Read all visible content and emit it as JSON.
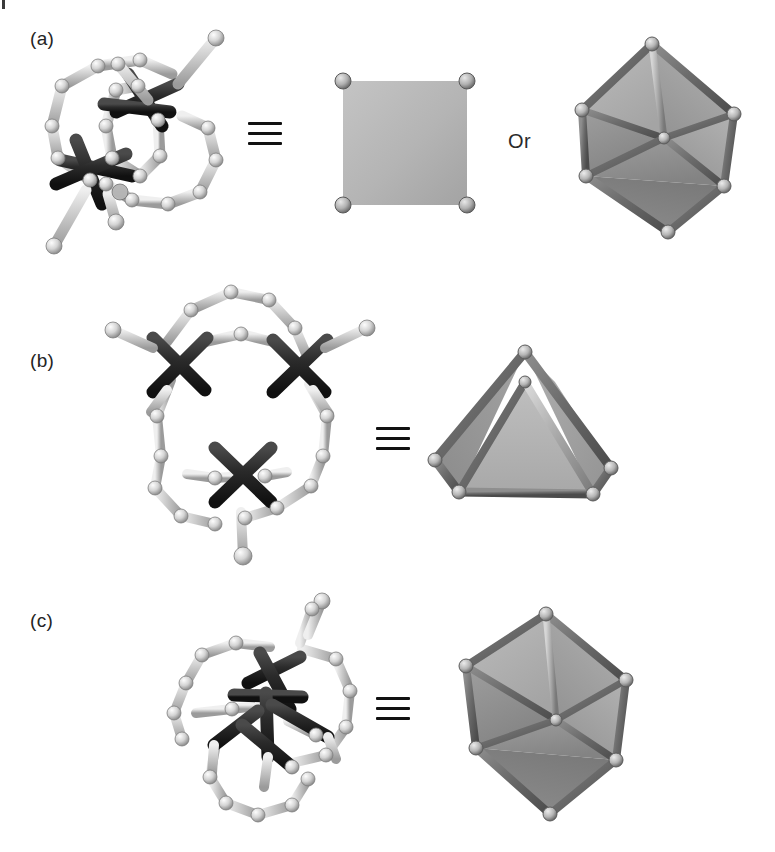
{
  "figure": {
    "type": "scientific-figure",
    "background_color": "#ffffff",
    "width": 775,
    "height": 852,
    "top_artifact": "|"
  },
  "colors": {
    "metal_dark": "#2b2b2b",
    "metal_dark_shade": "#141414",
    "ligand_light": "#c9c9c9",
    "ligand_light_shade": "#9e9e9e",
    "ligand_highlight": "#eeeeee",
    "node_sphere": "#d8d8d8",
    "polyhedron_face_light": "#b9b9b9",
    "polyhedron_face_mid": "#a6a6a6",
    "polyhedron_face_dark": "#8a8a8a",
    "polyhedron_edge": "#6e6e6e",
    "polyhedron_edge_dark": "#5a5a5a",
    "polyhedron_vertex": "#cfcfcf",
    "text": "#242424",
    "equiv_bar": "#111111"
  },
  "panels": [
    {
      "id": "a",
      "label": "(a)",
      "label_x": 30,
      "label_y": 28,
      "structure": {
        "name": "square-cage-structure",
        "geometry": "square",
        "metal_centers": 2,
        "description": "Ball-and-stick cage with two octahedral metal nodes bridged by macrocyclic ligand loops"
      },
      "equivalence_symbol": "≡",
      "equivalence_x": 248,
      "equivalence_y": 122,
      "polyhedra": [
        {
          "name": "square-polyhedron",
          "shape": "square",
          "vertices": 4,
          "faces": 1,
          "edges": 4
        },
        {
          "name": "octahedron-polyhedron",
          "shape": "octahedron",
          "vertices": 6,
          "faces": 8,
          "edges": 12
        }
      ],
      "connector_text": "Or",
      "connector_x": 508,
      "connector_y": 130
    },
    {
      "id": "b",
      "label": "(b)",
      "label_x": 30,
      "label_y": 350,
      "structure": {
        "name": "tetrahedral-cage-structure",
        "geometry": "tetrahedron",
        "metal_centers": 3,
        "description": "Ball-and-stick cage with three visible octahedral metal nodes forming a tetrahedral array"
      },
      "equivalence_symbol": "≡",
      "equivalence_x": 376,
      "equivalence_y": 427,
      "polyhedra": [
        {
          "name": "tetrahedron-polyhedron",
          "shape": "tetrahedron",
          "vertices": 4,
          "faces": 4,
          "edges": 6
        }
      ]
    },
    {
      "id": "c",
      "label": "(c)",
      "label_x": 30,
      "label_y": 610,
      "structure": {
        "name": "octahedral-cage-structure",
        "geometry": "octahedron",
        "metal_centers": 3,
        "description": "Ball-and-stick cage with metal nodes and macrocyclic ligand rings in an octahedral arrangement"
      },
      "equivalence_symbol": "≡",
      "equivalence_x": 376,
      "equivalence_y": 697,
      "polyhedra": [
        {
          "name": "octahedron-polyhedron",
          "shape": "octahedron",
          "vertices": 6,
          "faces": 8,
          "edges": 12
        }
      ]
    }
  ]
}
